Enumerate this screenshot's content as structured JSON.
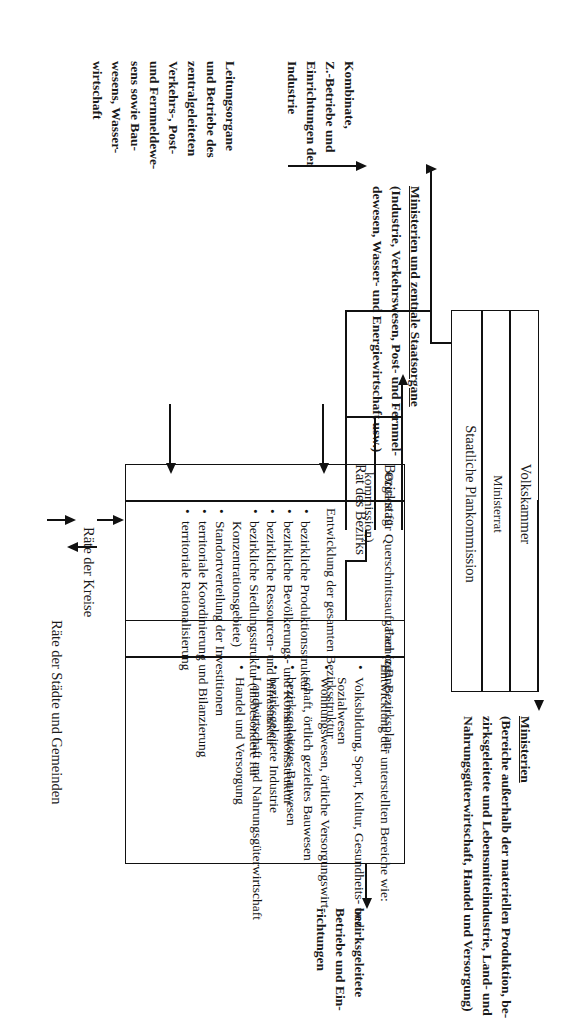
{
  "diagram": {
    "language": "de"
  },
  "central_box": {
    "name": "zentrale-staatsorgane-box",
    "rows": [
      "Volkskammer",
      "Ministerrat",
      "Staatliche Plankommission"
    ]
  },
  "labels": {
    "ministerien_zentrale": {
      "heading": "Ministerien und zentrale Staatsorgane",
      "lines": [
        "(Industrie, Verkehrswesen, Post- und Fernmel-",
        "dewesen, Wasser- und Energiewirtschaft usw.)"
      ]
    },
    "kombinate": {
      "lines": [
        "Kombinate,",
        "Z.-Betriebe und",
        "Einrichtungen der",
        "Industrie"
      ]
    },
    "leitungsorgane": {
      "lines": [
        "Leitungsorgane",
        "und Betriebe des",
        "zentralgeleiteten",
        "Verkehrs-, Post-",
        "und Fernmeldewe-",
        "sens sowie Bau-",
        "wesens, Wasser-",
        "wirtschaft"
      ]
    },
    "ministerien": {
      "heading": "Ministerien",
      "lines": [
        "(Bereiche außerhalb der materiellen Produktion, be-",
        "zirksgeleitete und Lebensmittelindustrie, Land- und",
        "Nahrungsgüterwirtschaft, Handel und Versorgung)"
      ]
    },
    "bezirksgeleitete_betriebe": {
      "lines": [
        "bezirksgeleitete",
        "Betriebe und Ein-",
        "richtungen"
      ]
    },
    "bezirkstag": "Bezirkstag",
    "rat_des_bezirks": "Rat des Bezirks",
    "raete_der_kreise": "Räte der Kreise",
    "raete_staedte_gemeinden": "Räte der Städte und Gemeinden"
  },
  "querschnitt_column": {
    "header_lines": [
      "Organe für Querschnittsaufgaben (z.B. Bezirksplan-",
      "kommission)"
    ],
    "intro": "Entwicklung der gesamten Bezirksstruktur",
    "bullets": [
      "bezirkliche Produktionsstruktur",
      "bezirkliche Bevölkerungs- und Konsumtionsstruktur",
      "bezirkliche Ressourcen- und Infrastruktur",
      "bezirkliche Siedlungsstruktur (insbesondere für",
      "Standortverteilung der Investitionen",
      "territoriale Koordinierung und Bilanzierung",
      "territoriale Rationalisierung"
    ],
    "bullet4_cont": "Konzentrationsgebiete)"
  },
  "fachorgane_column": {
    "header": "Fachorgane",
    "intro": "Entwicklung der unterstellten Bereiche wie:",
    "bullets": [
      "Volksbildung, Sport, Kultur, Gesundheits- und",
      "Wohnungswesen, örtliche Versorgungswirt-",
      "bezirksgeleitetes Bauwesen",
      "bezirksgeleitete Industrie",
      "Landwirtschaft und Nahrungsgüterwirtschaft",
      "Handel und Versorgung"
    ],
    "bullet1_cont": "Sozialwesen",
    "bullet2_cont": "schaft, örtlich gezieltes Bauwesen"
  },
  "colors": {
    "ink": "#111111",
    "paper": "#ffffff"
  }
}
